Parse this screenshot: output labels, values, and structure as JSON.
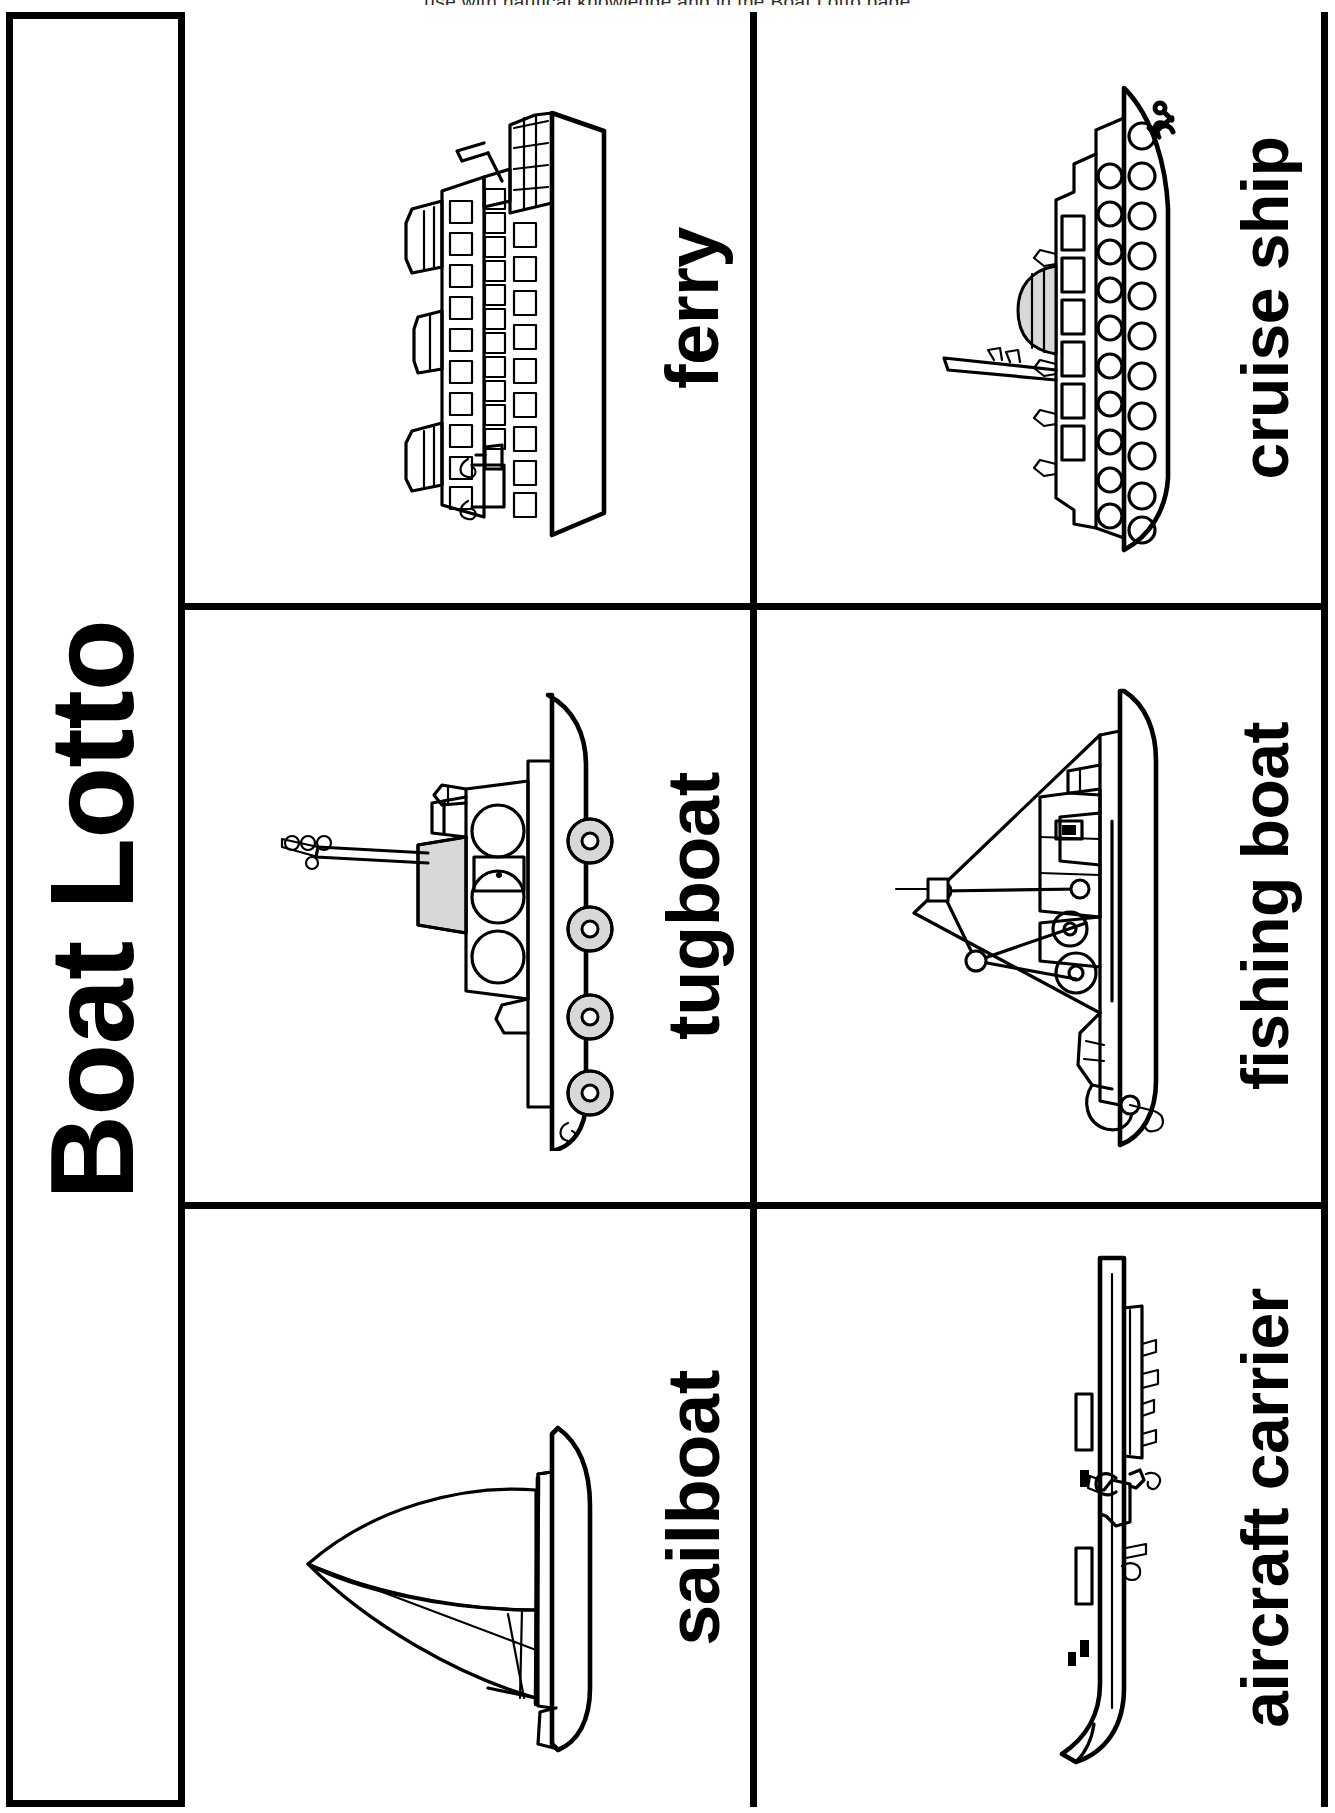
{
  "header": {
    "clipped_text": "use with nautical knowledge  and  in the  Boat Lotto page"
  },
  "title": {
    "text": "Boat Lotto"
  },
  "cards": [
    {
      "id": "ferry",
      "label": "ferry",
      "icon": "ferry-icon"
    },
    {
      "id": "tugboat",
      "label": "tugboat",
      "icon": "tugboat-icon"
    },
    {
      "id": "sailboat",
      "label": "sailboat",
      "icon": "sailboat-icon"
    },
    {
      "id": "cruise-ship",
      "label": "cruise ship",
      "icon": "cruise-ship-icon"
    },
    {
      "id": "fishing-boat",
      "label": "fishing boat",
      "icon": "fishing-boat-icon"
    },
    {
      "id": "aircraft-carrier",
      "label": "aircraft carrier",
      "icon": "aircraft-carrier-icon"
    }
  ],
  "colors": {
    "ink": "#000000",
    "paper": "#ffffff",
    "shade": "#d8d8d8",
    "header_ink": "#2b2b2b"
  }
}
